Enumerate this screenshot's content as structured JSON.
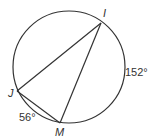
{
  "diagram": {
    "type": "inscribed-triangle-in-circle",
    "circle": {
      "cx": 69,
      "cy": 67,
      "r": 56
    },
    "points": [
      {
        "name": "I",
        "x": 101,
        "y": 23,
        "label_x": 103,
        "label_y": 17
      },
      {
        "name": "J",
        "x": 17,
        "y": 91,
        "label_x": 8,
        "label_y": 97
      },
      {
        "name": "M",
        "x": 60,
        "y": 123,
        "label_x": 55,
        "label_y": 136
      }
    ],
    "segments": [
      [
        "I",
        "J"
      ],
      [
        "I",
        "M"
      ],
      [
        "J",
        "M"
      ]
    ],
    "arcs": [
      {
        "label": "152°",
        "endpoints": [
          "I",
          "M"
        ],
        "label_x": 125,
        "label_y": 76
      },
      {
        "label": "56°",
        "endpoints": [
          "J",
          "M"
        ],
        "label_x": 19,
        "label_y": 121
      }
    ],
    "stroke_color": "#333333"
  }
}
